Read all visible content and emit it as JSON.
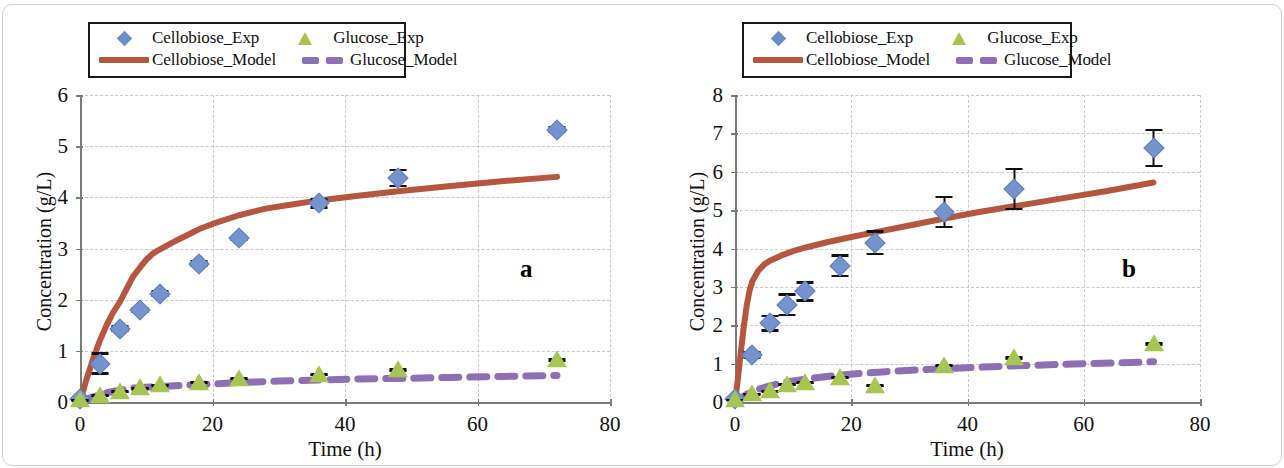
{
  "figure": {
    "panels": [
      {
        "tag": "a",
        "legend": {
          "entries": [
            {
              "label": "Cellobiose_Exp",
              "key": "diamond-marker-icon"
            },
            {
              "label": "Glucose_Exp",
              "key": "triangle-marker-icon"
            },
            {
              "label": "Cellobiose_Model",
              "key": "solid-line-icon"
            },
            {
              "label": "Glucose_Model",
              "key": "dashed-line-icon"
            }
          ]
        },
        "chart_data": {
          "type": "scatter",
          "title": "",
          "xlabel": "Time (h)",
          "ylabel": "Concentration (g/L)",
          "xlim": [
            0,
            80
          ],
          "ylim": [
            0,
            6
          ],
          "xticks": [
            0,
            20,
            40,
            60,
            80
          ],
          "yticks": [
            0,
            1,
            2,
            3,
            4,
            5,
            6
          ],
          "grid": true,
          "legend_position": "above-plot",
          "series": [
            {
              "name": "Cellobiose_Exp",
              "type": "scatter",
              "marker": "diamond",
              "color": "#7593cd",
              "x": [
                0,
                3,
                6,
                9,
                12,
                18,
                24,
                36,
                48,
                72
              ],
              "y": [
                0.05,
                0.75,
                1.43,
                1.8,
                2.12,
                2.7,
                3.2,
                3.88,
                4.38,
                5.32
              ],
              "yerr": [
                0.03,
                0.22,
                0.07,
                0.06,
                0.07,
                0.07,
                0.05,
                0.1,
                0.18,
                0.07
              ]
            },
            {
              "name": "Glucose_Exp",
              "type": "scatter",
              "marker": "triangle",
              "color": "#a7c552",
              "x": [
                0,
                3,
                6,
                9,
                12,
                18,
                24,
                36,
                48,
                72
              ],
              "y": [
                0.03,
                0.12,
                0.2,
                0.27,
                0.33,
                0.38,
                0.45,
                0.53,
                0.62,
                0.82
              ],
              "yerr": [
                0.02,
                0.02,
                0.02,
                0.02,
                0.02,
                0.02,
                0.02,
                0.03,
                0.04,
                0.04
              ]
            },
            {
              "name": "Cellobiose_Model",
              "type": "line",
              "style": "solid",
              "color": "#b5573e",
              "x": [
                0,
                1,
                2,
                3,
                4,
                5,
                6,
                7,
                8,
                9,
                10,
                11,
                12,
                14,
                16,
                18,
                20,
                24,
                28,
                32,
                36,
                42,
                48,
                56,
                64,
                72
              ],
              "y": [
                0.0,
                0.45,
                0.85,
                1.2,
                1.5,
                1.75,
                1.95,
                2.2,
                2.45,
                2.62,
                2.78,
                2.9,
                2.98,
                3.12,
                3.25,
                3.38,
                3.48,
                3.65,
                3.78,
                3.86,
                3.94,
                4.03,
                4.12,
                4.22,
                4.32,
                4.4
              ]
            },
            {
              "name": "Glucose_Model",
              "type": "line",
              "style": "dashed",
              "color": "#8e6fb5",
              "x": [
                0,
                2,
                4,
                6,
                8,
                10,
                12,
                16,
                20,
                24,
                30,
                36,
                42,
                48,
                56,
                64,
                72
              ],
              "y": [
                0.0,
                0.1,
                0.18,
                0.23,
                0.27,
                0.29,
                0.3,
                0.33,
                0.35,
                0.38,
                0.41,
                0.43,
                0.45,
                0.46,
                0.48,
                0.5,
                0.52
              ]
            }
          ]
        }
      },
      {
        "tag": "b",
        "legend": {
          "entries": [
            {
              "label": "Cellobiose_Exp",
              "key": "diamond-marker-icon"
            },
            {
              "label": "Glucose_Exp",
              "key": "triangle-marker-icon"
            },
            {
              "label": "Cellobiose_Model",
              "key": "solid-line-icon"
            },
            {
              "label": "Glucose_Model",
              "key": "dashed-line-icon"
            }
          ]
        },
        "chart_data": {
          "type": "scatter",
          "title": "",
          "xlabel": "Time (h)",
          "ylabel": "Concentration (g/L)",
          "xlim": [
            0,
            80
          ],
          "ylim": [
            0,
            8
          ],
          "xticks": [
            0,
            20,
            40,
            60,
            80
          ],
          "yticks": [
            0,
            1,
            2,
            3,
            4,
            5,
            6,
            7,
            8
          ],
          "grid": true,
          "legend_position": "above-plot",
          "series": [
            {
              "name": "Cellobiose_Exp",
              "type": "scatter",
              "marker": "diamond",
              "color": "#7593cd",
              "x": [
                0,
                3,
                6,
                9,
                12,
                18,
                24,
                36,
                48,
                72
              ],
              "y": [
                0.08,
                1.23,
                2.05,
                2.53,
                2.88,
                3.55,
                4.15,
                4.95,
                5.55,
                6.62
              ],
              "yerr": [
                0.05,
                0.1,
                0.22,
                0.3,
                0.27,
                0.3,
                0.33,
                0.42,
                0.55,
                0.5
              ]
            },
            {
              "name": "Glucose_Exp",
              "type": "scatter",
              "marker": "triangle",
              "color": "#a7c552",
              "x": [
                0,
                3,
                6,
                9,
                12,
                18,
                24,
                36,
                48,
                72
              ],
              "y": [
                0.05,
                0.2,
                0.28,
                0.45,
                0.5,
                0.63,
                0.42,
                0.95,
                1.15,
                1.52
              ],
              "yerr": [
                0.03,
                0.03,
                0.03,
                0.03,
                0.03,
                0.04,
                0.04,
                0.05,
                0.05,
                0.05
              ]
            },
            {
              "name": "Cellobiose_Model",
              "type": "line",
              "style": "solid",
              "color": "#b5573e",
              "x": [
                0,
                0.5,
                1,
                1.5,
                2,
                2.5,
                3,
                4,
                5,
                6,
                8,
                10,
                12,
                16,
                20,
                24,
                30,
                36,
                42,
                48,
                56,
                64,
                72
              ],
              "y": [
                0.0,
                0.6,
                1.3,
                1.95,
                2.5,
                2.9,
                3.15,
                3.42,
                3.58,
                3.68,
                3.82,
                3.93,
                4.02,
                4.17,
                4.3,
                4.42,
                4.6,
                4.78,
                4.95,
                5.1,
                5.3,
                5.5,
                5.72
              ]
            },
            {
              "name": "Glucose_Model",
              "type": "line",
              "style": "dashed",
              "color": "#8e6fb5",
              "x": [
                0,
                2,
                4,
                6,
                8,
                10,
                14,
                18,
                22,
                26,
                32,
                38,
                44,
                50,
                58,
                66,
                72
              ],
              "y": [
                0.0,
                0.2,
                0.33,
                0.42,
                0.5,
                0.55,
                0.63,
                0.7,
                0.75,
                0.79,
                0.84,
                0.88,
                0.92,
                0.95,
                0.99,
                1.02,
                1.05
              ]
            }
          ]
        }
      }
    ]
  }
}
